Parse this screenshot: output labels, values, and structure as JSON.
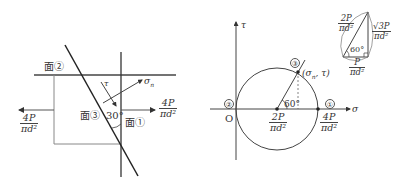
{
  "left_diagram": {
    "face2_label": "面②",
    "face3_label": "面③",
    "face1_label": "面①",
    "angle_label": "30°",
    "tau_label": "τ",
    "sigma_n_label": "σ",
    "sigma_n_sub": "n",
    "left_stress": {
      "num": "4P",
      "den": "πd²"
    },
    "right_stress": {
      "num": "4P",
      "den": "πd²"
    }
  },
  "mohr_circle": {
    "tau_axis_label": "τ",
    "sigma_axis_label": "σ",
    "origin_label": "O",
    "point1_label": "①",
    "point2_label": "②",
    "point3_label": "③",
    "point3_coords": "(σ",
    "point3_coords_sub": "n",
    "point3_coords_end": ", τ)",
    "angle_label": "60°",
    "center": {
      "num": "2P",
      "den": "πd²"
    },
    "right_point": {
      "num": "4P",
      "den": "πd²"
    }
  },
  "triangle_inset": {
    "hypotenuse": {
      "num": "2P",
      "den": "πd²"
    },
    "vertical": {
      "num": "√3P",
      "den": "πd²"
    },
    "base": {
      "num": "P",
      "den": "πd²"
    },
    "angle_label": "60°"
  }
}
